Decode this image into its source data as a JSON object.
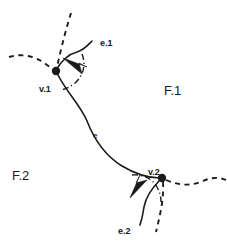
{
  "figure": {
    "background_color": "#ffffff",
    "ink_color": "#1a1a1a",
    "width": 227,
    "height": 244
  },
  "labels": {
    "vertex_1": "v.1",
    "vertex_2": "v.2",
    "edge_main": "e",
    "edge_1": "e.1",
    "edge_2": "e.2",
    "face_1": "F.1",
    "face_2": "F.2"
  },
  "vertices": [
    {
      "name": "v.1",
      "label": "v.1",
      "x": 56,
      "y": 71,
      "radius": 4.2
    },
    {
      "name": "v.2",
      "label": "v.2",
      "x": 162,
      "y": 178,
      "radius": 4.2
    }
  ],
  "edges": [
    {
      "name": "e",
      "label": "e",
      "style": "solid",
      "from": "v.1",
      "to": "v.2",
      "label_x": 93,
      "label_y": 136
    },
    {
      "name": "e.1",
      "label": "e.1",
      "style": "solid",
      "from": "v.1",
      "label_x": 101,
      "label_y": 45
    },
    {
      "name": "e.2",
      "label": "e.2",
      "style": "solid",
      "from": "v.2",
      "label_x": 120,
      "label_y": 234
    }
  ],
  "faces": [
    {
      "name": "F.1",
      "label": "F.1",
      "x": 166,
      "y": 92
    },
    {
      "name": "F.2",
      "label": "F.2",
      "x": 14,
      "y": 177
    }
  ],
  "arrows": [
    {
      "name": "arrow-e1-to-v1",
      "points_toward": "v.1",
      "direction": "up-left"
    },
    {
      "name": "arrow-e2-to-v2",
      "points_toward": "v.2",
      "direction": "down-left"
    }
  ],
  "dashed_curves": [
    {
      "name": "dashed-left-of-v1"
    },
    {
      "name": "dashed-above-v1"
    },
    {
      "name": "dashed-right-of-v2"
    },
    {
      "name": "dashed-below-v2"
    }
  ]
}
